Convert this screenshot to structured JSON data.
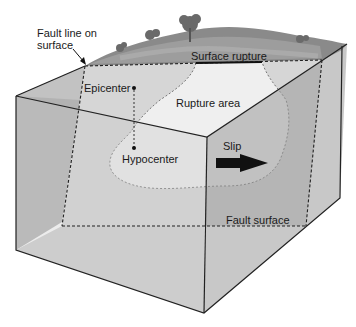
{
  "diagram": {
    "labels": {
      "fault_line_on_surface_1": "Fault line on",
      "fault_line_on_surface_2": "surface",
      "surface_rupture": "Surface rupture",
      "epicenter": "Epicenter",
      "rupture_area": "Rupture area",
      "hypocenter": "Hypocenter",
      "slip": "Slip",
      "fault_surface": "Fault surface"
    },
    "colors": {
      "left_face": "#b4b4b4",
      "front_face": "#c9c9c9",
      "right_face": "#9c9c9c",
      "fault_plane": "#dcdcdc",
      "rupture_area": "#eeeeee",
      "terrain": "#7d7d7d",
      "lines": "#222222"
    }
  }
}
